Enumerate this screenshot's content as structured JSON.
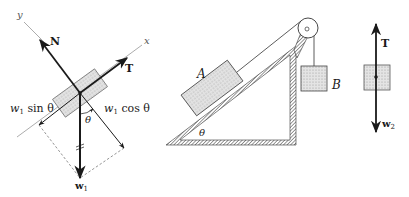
{
  "figure": {
    "left_fbd": {
      "axis_x_label": "x",
      "axis_y_label": "y",
      "normal_force_label": "N",
      "tension_label": "T",
      "weight_label": "w",
      "weight_subscript": "1",
      "component_sin_label": "w",
      "component_sin_subscript": "1",
      "component_sin_text": "sin θ",
      "component_cos_label": "w",
      "component_cos_subscript": "1",
      "component_cos_text": "cos θ",
      "angle_label": "θ"
    },
    "apparatus": {
      "block_a_label": "A",
      "block_b_label": "B",
      "incline_angle_label": "θ"
    },
    "right_fbd": {
      "tension_label": "T",
      "weight_label": "w",
      "weight_subscript": "2"
    },
    "colors": {
      "ink": "#1a1a1a",
      "block_fill": "#d9d9d9",
      "dashed": "#666666",
      "axis": "#888888"
    }
  }
}
